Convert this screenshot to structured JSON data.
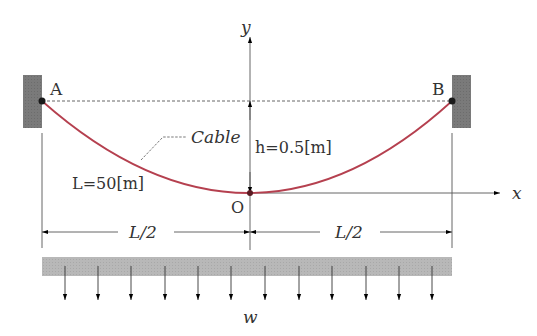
{
  "diagram": {
    "labels": {
      "point_a": "A",
      "point_b": "B",
      "origin": "O",
      "y_axis": "y",
      "x_axis": "x",
      "cable": "Cable",
      "sag": "h=0.5[m]",
      "length": "L=50[m]",
      "half_span_left": "L/2",
      "half_span_right": "L/2",
      "load": "w"
    },
    "values": {
      "L": "50 m",
      "h": "0.5 m"
    },
    "colors": {
      "cable": "#b5404f",
      "wall": "#777777",
      "load_bar": "#b8b8b8",
      "lines": "#444444",
      "arrows": "#000000"
    },
    "load_arrow_count": 12
  }
}
